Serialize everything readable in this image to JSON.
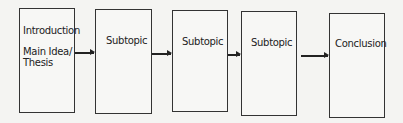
{
  "diagram": {
    "boxes": [
      {
        "lines": [
          "Introduction",
          "Main Idea/",
          "Thesis"
        ]
      },
      {
        "label": "Subtopic"
      },
      {
        "label": "Subtopic"
      },
      {
        "label": "Subtopic"
      },
      {
        "label": "Conclusion"
      }
    ]
  }
}
